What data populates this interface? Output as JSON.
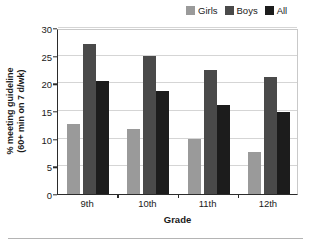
{
  "chart_data": {
    "type": "bar",
    "title": "",
    "subtitle": "",
    "xlabel": "Grade",
    "ylabel": "% meeting guideline (60+ min on 7 d/wk)",
    "ylabel_line1": "% meeting guideline",
    "ylabel_line2": "(60+ min on 7 d/wk)",
    "categories": [
      "9th",
      "10th",
      "11th",
      "12th"
    ],
    "series": [
      {
        "name": "Girls",
        "color": "#9a9a9a",
        "values": [
          12.6,
          11.8,
          9.9,
          7.6
        ]
      },
      {
        "name": "Boys",
        "color": "#4a4a4a",
        "values": [
          27.2,
          24.9,
          22.4,
          21.2
        ]
      },
      {
        "name": "All",
        "color": "#1c1c1c",
        "values": [
          20.5,
          18.6,
          16.1,
          14.8
        ]
      }
    ],
    "ylim": [
      0,
      30
    ],
    "yticks": [
      0,
      5,
      10,
      15,
      20,
      25,
      30
    ],
    "ytick_labels": [
      "0",
      "5",
      "10",
      "15",
      "20",
      "25",
      "30"
    ],
    "grid": true,
    "grid_axis": "y",
    "legend_position": "top-right"
  },
  "legend": {
    "entries": [
      {
        "label": "Girls",
        "color": "#9a9a9a"
      },
      {
        "label": "Boys",
        "color": "#4a4a4a"
      },
      {
        "label": "All",
        "color": "#1c1c1c"
      }
    ]
  },
  "axes": {
    "x_title": "Grade",
    "y_title_line1": "% meeting guideline",
    "y_title_line2": "(60+ min on 7 d/wk)"
  },
  "colors": {
    "girls": "#9a9a9a",
    "boys": "#4a4a4a",
    "all": "#1c1c1c",
    "grid": "#d5d5d5",
    "axis": "#2b2b2b",
    "frame": "#c9c9c9",
    "background": "#ffffff"
  }
}
